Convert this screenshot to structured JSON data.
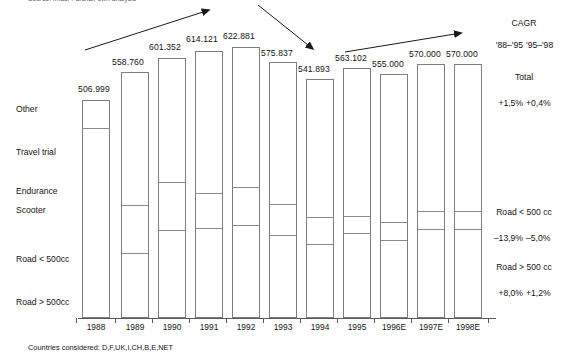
{
  "source_note": "Source: Imas, Parsifal, own analysis",
  "footnote": "Countries considered: D,F,UK,I,CH,B,E,NET",
  "categories": [
    {
      "name": "Other",
      "label": "Other",
      "top": 104
    },
    {
      "name": "Travel trial",
      "label": "Travel trial",
      "top": 147
    },
    {
      "name": "Endurance",
      "label": "Endurance",
      "top": 186
    },
    {
      "name": "Scooter",
      "label": "Scooter",
      "top": 205
    },
    {
      "name": "Road < 500cc",
      "label": "Road < 500cc",
      "top": 254
    },
    {
      "name": "Road > 500cc",
      "label": "Road > 500cc",
      "top": 297
    }
  ],
  "right_panel": {
    "cagr_title": "CAGR",
    "period_1": "'88–'95",
    "period_2": "'95–'98",
    "rows": [
      {
        "label": "Total",
        "v1": "+1,5%",
        "v2": "+0,4%"
      },
      {
        "label": "Road < 500 cc",
        "v1": "–13,9%",
        "v2": "–5,0%"
      },
      {
        "label": "Road > 500 cc",
        "v1": "+8,0%",
        "v2": "+1,2%"
      }
    ]
  },
  "chart_data": {
    "type": "bar",
    "title": "",
    "subtitle": "",
    "xlabel": "",
    "ylabel": "",
    "grid": false,
    "legend_position": "left",
    "stacked": true,
    "ylim": [
      0,
      640
    ],
    "categories": [
      "1988",
      "1989",
      "1990",
      "1991",
      "1992",
      "1993",
      "1994",
      "1995",
      "1996E",
      "1997E",
      "1998E"
    ],
    "value_labels": [
      "506.999",
      "558.760",
      "601.352",
      "614.121",
      "622.881",
      "575.837",
      "541.893",
      "563.102",
      "555.000",
      "570.000",
      "570.000"
    ],
    "values": [
      506999,
      558760,
      601352,
      614121,
      622881,
      575837,
      541893,
      563102,
      555000,
      570000,
      570000
    ],
    "series_names": [
      "Road > 500cc",
      "Road < 500cc",
      "Scooter",
      "Endurance",
      "Travel trial",
      "Other"
    ],
    "annotations": [
      "rising-arrow-1988-1992",
      "falling-arrow-1992-1995",
      "rising-arrow-1995-1998"
    ],
    "bars": [
      {
        "x": 82,
        "w": 28,
        "top": 100,
        "dividers": [
          128
        ]
      },
      {
        "x": 121,
        "w": 28,
        "top": 72,
        "dividers": [
          205,
          253
        ]
      },
      {
        "x": 158,
        "w": 28,
        "top": 58,
        "dividers": [
          182,
          230
        ]
      },
      {
        "x": 195,
        "w": 28,
        "top": 51,
        "dividers": [
          193,
          228
        ]
      },
      {
        "x": 232,
        "w": 28,
        "top": 47,
        "dividers": [
          187,
          225
        ]
      },
      {
        "x": 269,
        "w": 28,
        "top": 62,
        "dividers": [
          204,
          235
        ]
      },
      {
        "x": 306,
        "w": 28,
        "top": 79,
        "dividers": [
          217,
          244
        ]
      },
      {
        "x": 343,
        "w": 28,
        "top": 68,
        "dividers": [
          216,
          233
        ]
      },
      {
        "x": 380,
        "w": 28,
        "top": 74,
        "dividers": [
          222,
          240
        ]
      },
      {
        "x": 417,
        "w": 28,
        "top": 64,
        "dividers": [
          211,
          229
        ]
      },
      {
        "x": 454,
        "w": 28,
        "top": 64,
        "dividers": [
          211,
          229
        ]
      }
    ],
    "label_positions": [
      {
        "x": 78,
        "y": 84
      },
      {
        "x": 112,
        "y": 57
      },
      {
        "x": 149,
        "y": 42
      },
      {
        "x": 186,
        "y": 34
      },
      {
        "x": 223,
        "y": 31
      },
      {
        "x": 261,
        "y": 48
      },
      {
        "x": 298,
        "y": 64
      },
      {
        "x": 335,
        "y": 53
      },
      {
        "x": 372,
        "y": 59
      },
      {
        "x": 409,
        "y": 49
      },
      {
        "x": 446,
        "y": 49
      }
    ]
  }
}
